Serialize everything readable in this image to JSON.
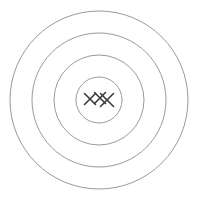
{
  "canvas": {
    "width": 198,
    "height": 200,
    "background_color": "#ffffff"
  },
  "figure": {
    "name": "target-bullseye-with-hits"
  },
  "chart_data": {
    "type": "scatter",
    "subtitle": "",
    "xlabel": "",
    "ylabel": "",
    "grid": false,
    "legend_position": "none",
    "xlim": [
      -100,
      100
    ],
    "ylim": [
      -100,
      100
    ],
    "center": {
      "x": 99,
      "y": 100
    },
    "rings": [
      {
        "label": "ring-4-outer",
        "radius": 89,
        "stroke": "#9a9a9a",
        "stroke_width": 1,
        "fill": "none"
      },
      {
        "label": "ring-3",
        "radius": 67,
        "stroke": "#9a9a9a",
        "stroke_width": 1,
        "fill": "none"
      },
      {
        "label": "ring-2",
        "radius": 45,
        "stroke": "#9a9a9a",
        "stroke_width": 1,
        "fill": "none"
      },
      {
        "label": "ring-1-bullseye",
        "radius": 23,
        "stroke": "#9a9a9a",
        "stroke_width": 1,
        "fill": "none"
      }
    ],
    "series": [
      {
        "name": "hits",
        "marker": "x",
        "color": "#3a3a3a",
        "points": [
          {
            "label": "hit-1",
            "x": 90,
            "y": 99,
            "size": 11
          },
          {
            "label": "hit-2",
            "x": 100,
            "y": 98,
            "size": 11
          },
          {
            "label": "hit-3",
            "x": 107,
            "y": 100,
            "size": 13
          }
        ]
      }
    ],
    "annotations": []
  },
  "colors": {
    "ring_stroke": "#9a9a9a",
    "hit_mark": "#3a3a3a",
    "background": "#ffffff"
  }
}
